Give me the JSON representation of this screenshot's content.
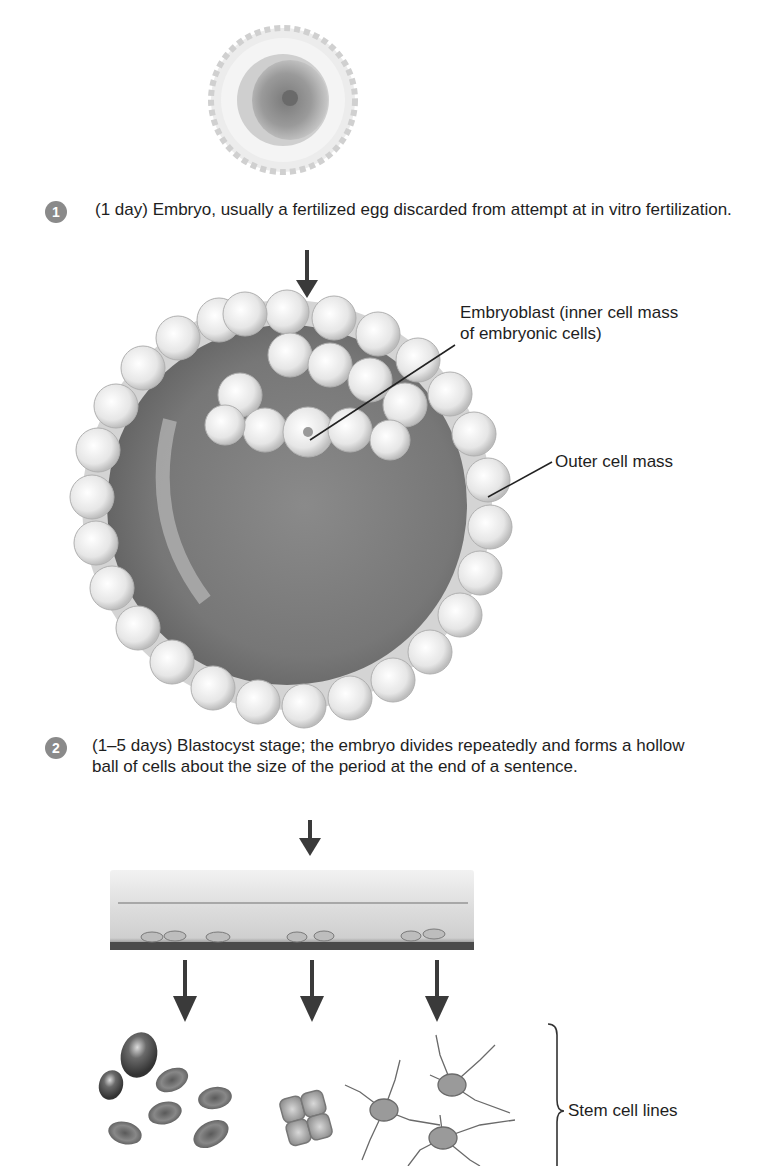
{
  "steps": [
    {
      "number": "1",
      "text": "(1 day) Embryo, usually a fertilized egg discarded from attempt at in vitro fertilization."
    },
    {
      "number": "2",
      "text": "(1–5 days) Blastocyst stage; the embryo divides repeatedly and forms a hollow ball of cells about the size of the period at the end of a sentence."
    }
  ],
  "labels": {
    "embryoblast": "Embryoblast (inner cell mass of embryonic cells)",
    "outer_cell_mass": "Outer cell mass",
    "stem_cell_lines": "Stem cell lines"
  },
  "illustrations": {
    "egg": "fertilized-egg",
    "blastocyst": "blastocyst",
    "dish": "culture-dish",
    "cell_types": [
      "blood-cells",
      "epithelial-cells",
      "nerve-cells"
    ]
  },
  "colors": {
    "badge": "#8a8a8a",
    "arrow": "#3a3a3a",
    "text": "#1e1e1e"
  }
}
